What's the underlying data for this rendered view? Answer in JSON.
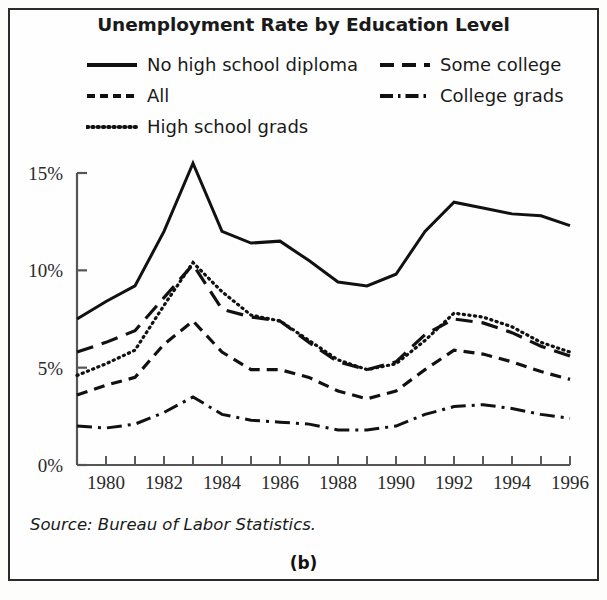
{
  "figure": {
    "title": "Unemployment Rate by Education Level",
    "source_note": "Source: Bureau of Labor Statistics.",
    "panel_label": "(b)",
    "ink_color": "#111111",
    "background_color": "#fefefe",
    "border_color": "#2b2b2b"
  },
  "legend": {
    "items": [
      {
        "label": "No high school diploma",
        "style": "solid",
        "column": 1,
        "row": 1
      },
      {
        "label": "All",
        "style": "dashed-short",
        "column": 1,
        "row": 2
      },
      {
        "label": "High school grads",
        "style": "dotted",
        "column": 1,
        "row": 3
      },
      {
        "label": "Some college",
        "style": "dashed-long",
        "column": 2,
        "row": 1
      },
      {
        "label": "College grads",
        "style": "dash-dot",
        "column": 2,
        "row": 2
      }
    ]
  },
  "axes": {
    "y_tick_labels": [
      "15%",
      "10%",
      "5%",
      "0%"
    ],
    "y_tick_values": [
      15,
      10,
      5,
      0
    ],
    "x_tick_labels": [
      "1980",
      "1982",
      "1984",
      "1986",
      "1988",
      "1990",
      "1992",
      "1994",
      "1996"
    ],
    "x_tick_values": [
      1980,
      1982,
      1984,
      1986,
      1988,
      1990,
      1992,
      1994,
      1996
    ],
    "x_minor_years": [
      1979,
      1980,
      1981,
      1982,
      1983,
      1984,
      1985,
      1986,
      1987,
      1988,
      1989,
      1990,
      1991,
      1992,
      1993,
      1994,
      1995,
      1996
    ],
    "xlabel": "",
    "ylabel": "",
    "xlim": [
      1979,
      1996
    ],
    "ylim": [
      0,
      16.2
    ],
    "grid": false
  },
  "chart_data": {
    "type": "line",
    "title": "Unemployment Rate by Education Level",
    "subtitle": "",
    "xlabel": "",
    "ylabel": "",
    "xlim": [
      1979,
      1996
    ],
    "ylim": [
      0,
      16.2
    ],
    "grid": false,
    "legend_position": "top",
    "annotations": [
      "Source: Bureau of Labor Statistics.",
      "(b)"
    ],
    "x": [
      1979,
      1980,
      1981,
      1982,
      1983,
      1984,
      1985,
      1986,
      1987,
      1988,
      1989,
      1990,
      1991,
      1992,
      1993,
      1994,
      1995,
      1996
    ],
    "series": [
      {
        "name": "No high school diploma",
        "style": "solid",
        "values": [
          7.5,
          8.4,
          9.2,
          12.0,
          15.5,
          12.0,
          11.4,
          11.5,
          10.5,
          9.4,
          9.2,
          9.8,
          12.0,
          13.5,
          13.2,
          12.9,
          12.8,
          12.3
        ]
      },
      {
        "name": "Some college",
        "style": "dashed-long",
        "values": [
          5.8,
          6.3,
          6.9,
          8.6,
          10.3,
          8.0,
          7.6,
          7.4,
          6.3,
          5.3,
          4.9,
          5.3,
          6.7,
          7.5,
          7.3,
          6.8,
          6.1,
          5.6
        ]
      },
      {
        "name": "High school grads",
        "style": "dotted",
        "values": [
          4.6,
          5.2,
          5.9,
          8.2,
          10.4,
          8.9,
          7.7,
          7.4,
          6.4,
          5.4,
          4.9,
          5.2,
          6.4,
          7.8,
          7.6,
          7.1,
          6.3,
          5.8
        ]
      },
      {
        "name": "All",
        "style": "dashed-short",
        "values": [
          3.6,
          4.1,
          4.5,
          6.2,
          7.4,
          5.8,
          4.9,
          4.9,
          4.5,
          3.8,
          3.4,
          3.8,
          4.9,
          5.9,
          5.7,
          5.3,
          4.8,
          4.4
        ]
      },
      {
        "name": "College grads",
        "style": "dash-dot",
        "values": [
          2.0,
          1.9,
          2.1,
          2.7,
          3.5,
          2.6,
          2.3,
          2.2,
          2.1,
          1.8,
          1.8,
          2.0,
          2.6,
          3.0,
          3.1,
          2.9,
          2.6,
          2.4
        ]
      }
    ]
  }
}
